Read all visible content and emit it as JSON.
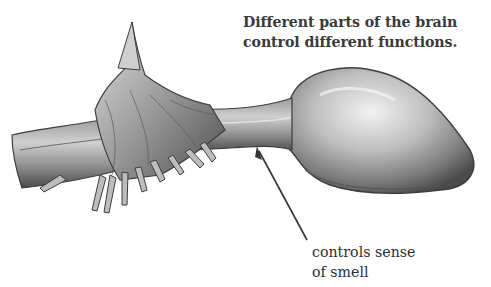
{
  "caption": {
    "line1": "Different parts of the brain",
    "line2": "control different functions."
  },
  "labels": [
    {
      "id": "olfactory",
      "line1": "controls sense",
      "line2": "of smell"
    }
  ],
  "illustration": {
    "subject": "olfactory-bulb-and-tract",
    "colors": {
      "shade_dark": "#3c3c3c",
      "shade_mid": "#8a8a8a",
      "shade_light": "#d8d8d8",
      "arrow": "#333333"
    }
  }
}
